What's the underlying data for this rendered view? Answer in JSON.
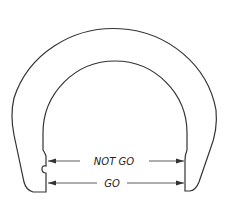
{
  "diagram": {
    "labels": {
      "not_go": "NOT GO",
      "go": "GO"
    },
    "stroke_color": "#333333",
    "background": "#ffffff"
  }
}
